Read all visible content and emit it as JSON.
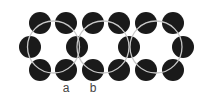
{
  "diagram": {
    "width": 210,
    "height": 97,
    "colors": {
      "background": "#ffffff",
      "atom_fill": "#1a1a1a",
      "ring_stroke": "#c8c8c8",
      "label": "#444444"
    },
    "atom_radius": 11,
    "atoms": [
      {
        "x": 40,
        "y": 23
      },
      {
        "x": 66,
        "y": 23
      },
      {
        "x": 93,
        "y": 23
      },
      {
        "x": 119,
        "y": 23
      },
      {
        "x": 146,
        "y": 23
      },
      {
        "x": 173,
        "y": 23
      },
      {
        "x": 30,
        "y": 47
      },
      {
        "x": 77,
        "y": 47
      },
      {
        "x": 129,
        "y": 47
      },
      {
        "x": 183,
        "y": 47
      },
      {
        "x": 40,
        "y": 70
      },
      {
        "x": 66,
        "y": 70
      },
      {
        "x": 93,
        "y": 70
      },
      {
        "x": 119,
        "y": 70
      },
      {
        "x": 146,
        "y": 70
      },
      {
        "x": 173,
        "y": 70
      }
    ],
    "rings": [
      {
        "cx": 53.5,
        "cy": 47,
        "r": 26
      },
      {
        "cx": 103,
        "cy": 47,
        "r": 26
      },
      {
        "cx": 156,
        "cy": 47,
        "r": 26
      }
    ],
    "labels": [
      {
        "text": "a",
        "x": 66,
        "y": 92
      },
      {
        "text": "b",
        "x": 93,
        "y": 92
      }
    ]
  }
}
